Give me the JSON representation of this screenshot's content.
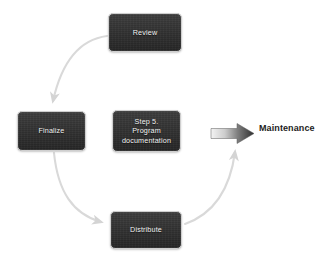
{
  "diagram": {
    "type": "cycle-flow",
    "background_color": "#ffffff",
    "node_fill_color": "#2d2d2d",
    "node_text_color": "#f2f2f2",
    "connector_color": "#d9d9d9",
    "block_arrow_color": "#3a3a3a",
    "nodes": [
      {
        "id": "review",
        "label": "Review",
        "icon": "process-box"
      },
      {
        "id": "finalize",
        "label": "Finalize",
        "icon": "process-box"
      },
      {
        "id": "step5",
        "label": "Step 5.\nProgram\ndocumentation",
        "icon": "process-box"
      },
      {
        "id": "distribute",
        "label": "Distribute",
        "icon": "process-box"
      }
    ],
    "connectors": [
      {
        "id": "review-to-finalize",
        "from": "review",
        "to": "finalize",
        "style": "curved-arrow"
      },
      {
        "id": "finalize-to-distribute",
        "from": "finalize",
        "to": "distribute",
        "style": "curved-arrow"
      },
      {
        "id": "distribute-to-review",
        "from": "distribute",
        "to": "maintenance",
        "style": "curved-arrow"
      }
    ],
    "callout": {
      "id": "maintenance",
      "label": "Maintenance",
      "arrow_icon": "block-arrow-right"
    }
  }
}
